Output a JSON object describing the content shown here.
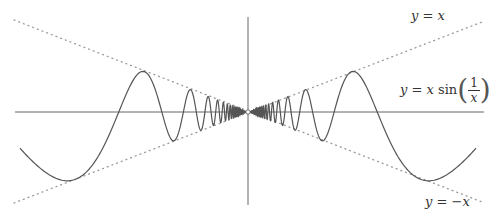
{
  "chart_data": {
    "type": "line",
    "title": "",
    "xlabel": "",
    "ylabel": "",
    "grid": false,
    "series": [
      {
        "name": "y = x sin(1/x)",
        "style": "solid",
        "function": "x*sin(1/x)",
        "x_range": [
          -0.27,
          0.27
        ]
      },
      {
        "name": "y = x",
        "style": "dotted",
        "function": "x"
      },
      {
        "name": "y = -x",
        "style": "dotted",
        "function": "-x"
      }
    ],
    "annotations": [
      "y = x",
      "y = x sin(1/x)",
      "y = -x"
    ],
    "origin_marker": "hollow-circle"
  },
  "labels": {
    "upper_line": {
      "lhs": "y",
      "eq": "=",
      "rhs": "x"
    },
    "curve": {
      "lhs": "y",
      "eq": "=",
      "x": "x",
      "fn": "sin",
      "num": "1",
      "den": "x",
      "lparen": "(",
      "rparen": ")"
    },
    "lower_line": {
      "lhs": "y",
      "eq": "=",
      "rhs": "−x"
    }
  },
  "colors": {
    "axis": "#555555",
    "curve": "#555555",
    "dotted": "#999999"
  }
}
